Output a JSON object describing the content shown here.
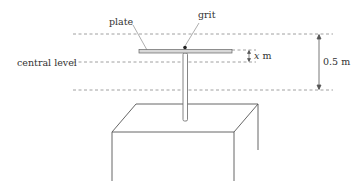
{
  "diagram": {
    "labels": {
      "plate": "plate",
      "grit": "grit",
      "central_level": "central level",
      "x_var": "x",
      "x_unit": " m",
      "amplitude": "0.5 m"
    },
    "colors": {
      "line": "#555555",
      "dash": "#888888",
      "plate_fill": "#d8d8d8",
      "grit": "#222222"
    }
  }
}
